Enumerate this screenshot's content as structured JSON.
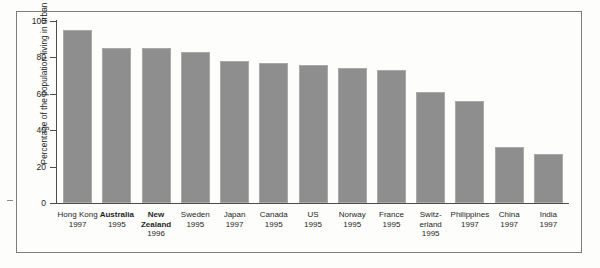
{
  "chart_data": {
    "type": "bar",
    "title": "",
    "subtitle": "",
    "xlabel": "",
    "ylabel": "Percentage of the population living in urban centres",
    "ylim": [
      0,
      100
    ],
    "yticks": [
      0,
      20,
      40,
      60,
      80,
      100
    ],
    "grid": false,
    "legend": "none",
    "bar_color": "#8e8e8e",
    "categories": [
      "Hong Kong",
      "Australia",
      "New Zealand",
      "Sweden",
      "Japan",
      "Canada",
      "US",
      "Norway",
      "France",
      "Switz-erland",
      "Philippines",
      "China",
      "India"
    ],
    "years": [
      "1997",
      "1995",
      "1996",
      "1995",
      "1997",
      "1995",
      "1995",
      "1995",
      "1995",
      "1995",
      "1997",
      "1997",
      "1997"
    ],
    "values": [
      95,
      85,
      85,
      83,
      78,
      77,
      76,
      74,
      73,
      61,
      56,
      31,
      27
    ],
    "emphasized": [
      "Australia",
      "New Zealand"
    ]
  },
  "axis": {
    "ytick_labels": [
      "100",
      "80",
      "60",
      "40",
      "20",
      "0"
    ]
  },
  "xlabels": [
    {
      "name": "Hong Kong",
      "name_line2": "",
      "year": "1997",
      "bold": false
    },
    {
      "name": "Australia",
      "name_line2": "",
      "year": "1995",
      "bold": true
    },
    {
      "name": "New",
      "name_line2": "Zealand",
      "year": "1996",
      "bold": true
    },
    {
      "name": "Sweden",
      "name_line2": "",
      "year": "1995",
      "bold": false
    },
    {
      "name": "Japan",
      "name_line2": "",
      "year": "1997",
      "bold": false
    },
    {
      "name": "Canada",
      "name_line2": "",
      "year": "1995",
      "bold": false
    },
    {
      "name": "US",
      "name_line2": "",
      "year": "1995",
      "bold": false
    },
    {
      "name": "Norway",
      "name_line2": "",
      "year": "1995",
      "bold": false
    },
    {
      "name": "France",
      "name_line2": "",
      "year": "1995",
      "bold": false
    },
    {
      "name": "Switz-",
      "name_line2": "erland",
      "year": "1995",
      "bold": false
    },
    {
      "name": "Philippines",
      "name_line2": "",
      "year": "1997",
      "bold": false
    },
    {
      "name": "China",
      "name_line2": "",
      "year": "1997",
      "bold": false
    },
    {
      "name": "India",
      "name_line2": "",
      "year": "1997",
      "bold": false
    }
  ]
}
